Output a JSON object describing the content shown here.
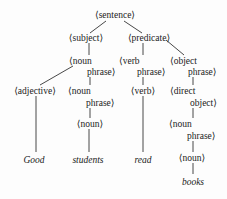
{
  "diagram": {
    "type": "parse-tree",
    "nodes": {
      "sentence": "⟨sentence⟩",
      "subject": "⟨subject⟩",
      "predicate": "⟨predicate⟩",
      "subj_np_1": "⟨noun",
      "subj_np_2": "phrase⟩",
      "verb_phrase_1": "⟨verb",
      "verb_phrase_2": "phrase⟩",
      "object_phrase_1": "⟨object",
      "object_phrase_2": "phrase⟩",
      "adjective": "⟨adjective⟩",
      "inner_np_1": "⟨noun",
      "inner_np_2": "phrase⟩",
      "inner_noun": "⟨noun⟩",
      "verb": "⟨verb⟩",
      "direct_object_1": "⟨direct",
      "direct_object_2": "object⟩",
      "obj_np_1": "⟨noun",
      "obj_np_2": "phrase⟩",
      "obj_noun": "⟨noun⟩"
    },
    "leaves": {
      "good": "Good",
      "students": "students",
      "read": "read",
      "books": "books"
    },
    "edges": [
      [
        "sentence",
        "subject"
      ],
      [
        "sentence",
        "predicate"
      ],
      [
        "subject",
        "noun phrase"
      ],
      [
        "predicate",
        "verb phrase"
      ],
      [
        "predicate",
        "object phrase"
      ],
      [
        "noun phrase",
        "adjective"
      ],
      [
        "noun phrase",
        "noun phrase"
      ],
      [
        "noun phrase",
        "noun"
      ],
      [
        "verb phrase",
        "verb"
      ],
      [
        "object phrase",
        "direct object"
      ],
      [
        "direct object",
        "noun phrase"
      ],
      [
        "noun phrase",
        "noun"
      ],
      [
        "adjective",
        "Good"
      ],
      [
        "noun",
        "students"
      ],
      [
        "verb",
        "read"
      ],
      [
        "noun",
        "books"
      ]
    ]
  }
}
